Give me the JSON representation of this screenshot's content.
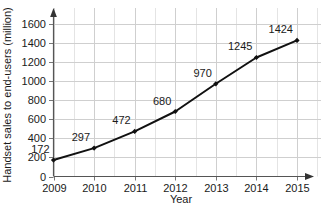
{
  "chart_data": {
    "type": "line",
    "title": "",
    "xlabel": "Year",
    "ylabel": "Handset sales to end-users (million)",
    "categories": [
      "2009",
      "2010",
      "2011",
      "2012",
      "2013",
      "2014",
      "2015"
    ],
    "values": [
      172,
      297,
      472,
      680,
      970,
      1245,
      1424
    ],
    "point_labels": [
      "172",
      "297",
      "472",
      "680",
      "970",
      "1245",
      "1424"
    ],
    "series": [
      {
        "name": "Handset sales to end-users",
        "values": [
          172,
          297,
          472,
          680,
          970,
          1245,
          1424
        ],
        "color": "#111111",
        "marker": "filled-diamond"
      }
    ],
    "ylim": [
      0,
      1700
    ],
    "y_ticks": [
      0,
      200,
      400,
      600,
      800,
      1000,
      1200,
      1400,
      1600
    ],
    "y_tick_labels": [
      "0",
      "200",
      "400",
      "600",
      "800",
      "1000",
      "1200",
      "1400",
      "1600"
    ],
    "x_tick_labels": [
      "2009",
      "2010",
      "2011",
      "2012",
      "2013",
      "2014",
      "2015"
    ],
    "grid": true,
    "grid_minor_x": true,
    "legend": "none",
    "axis_arrows": true,
    "colors": {
      "line": "#111111",
      "marker": "#111111",
      "grid_major": "#cfcfcf",
      "grid_minor": "#e4e4e4",
      "axis": "#555555",
      "text": "#1a1a1a",
      "background": "#ffffff"
    }
  }
}
